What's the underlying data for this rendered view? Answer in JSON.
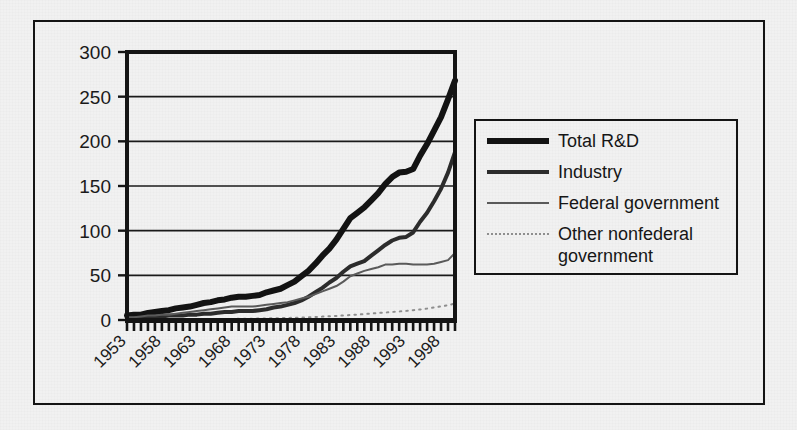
{
  "chart_data": {
    "type": "line",
    "title": "",
    "xlabel": "",
    "ylabel": "",
    "xlim": [
      1953,
      2000
    ],
    "ylim": [
      0,
      300
    ],
    "ytick_values": [
      0,
      50,
      100,
      150,
      200,
      250,
      300
    ],
    "ytick_labels": [
      "0",
      "50",
      "100",
      "150",
      "200",
      "250",
      "300"
    ],
    "xtick_labels": [
      "1953",
      "1958",
      "1963",
      "1968",
      "1973",
      "1978",
      "1983",
      "1988",
      "1993",
      "1998"
    ],
    "xtick_values": [
      1953,
      1958,
      1963,
      1968,
      1973,
      1978,
      1983,
      1988,
      1993,
      1998
    ],
    "xtick_rotation": 45,
    "minor_xticks": "annual",
    "grid": "horizontal",
    "legend_position": "right-outside",
    "x": [
      1953,
      1954,
      1955,
      1956,
      1957,
      1958,
      1959,
      1960,
      1961,
      1962,
      1963,
      1964,
      1965,
      1966,
      1967,
      1968,
      1969,
      1970,
      1971,
      1972,
      1973,
      1974,
      1975,
      1976,
      1977,
      1978,
      1979,
      1980,
      1981,
      1982,
      1983,
      1984,
      1985,
      1986,
      1987,
      1988,
      1989,
      1990,
      1991,
      1992,
      1993,
      1994,
      1995,
      1996,
      1997,
      1998,
      1999,
      2000
    ],
    "series": [
      {
        "name": "Total R&D",
        "style": "thick-solid",
        "color": "#131313",
        "linewidth": 6,
        "values": [
          5,
          6,
          6,
          8,
          9,
          10,
          11,
          13,
          14,
          15,
          17,
          19,
          20,
          22,
          23,
          25,
          26,
          26,
          27,
          28,
          31,
          33,
          35,
          39,
          43,
          49,
          55,
          63,
          72,
          80,
          90,
          102,
          114,
          120,
          126,
          134,
          142,
          152,
          160,
          165,
          166,
          169,
          184,
          197,
          212,
          227,
          247,
          268
        ]
      },
      {
        "name": "Industry",
        "style": "medium-solid",
        "color": "#2c2c2c",
        "linewidth": 4,
        "values": [
          2,
          2,
          2,
          3,
          4,
          4,
          5,
          5,
          5,
          6,
          6,
          7,
          7,
          8,
          9,
          9,
          10,
          10,
          10,
          11,
          12,
          14,
          15,
          17,
          19,
          22,
          26,
          31,
          36,
          42,
          47,
          54,
          60,
          63,
          66,
          72,
          78,
          84,
          89,
          92,
          93,
          98,
          110,
          120,
          133,
          147,
          165,
          188
        ]
      },
      {
        "name": "Federal government",
        "style": "thin-solid",
        "color": "#5a5a5a",
        "linewidth": 2,
        "values": [
          3,
          3,
          4,
          5,
          5,
          6,
          6,
          7,
          8,
          9,
          10,
          11,
          12,
          13,
          14,
          15,
          15,
          15,
          15,
          16,
          17,
          18,
          19,
          20,
          22,
          24,
          26,
          29,
          32,
          35,
          38,
          43,
          49,
          52,
          55,
          57,
          59,
          62,
          62,
          63,
          63,
          62,
          62,
          62,
          63,
          65,
          67,
          75
        ]
      },
      {
        "name": "Other nonfederal government",
        "style": "dotted",
        "color": "#8e8e8e",
        "linewidth": 2,
        "values": [
          0.2,
          0.2,
          0.3,
          0.3,
          0.4,
          0.4,
          0.5,
          0.5,
          0.6,
          0.6,
          0.7,
          0.8,
          0.9,
          1.0,
          1.1,
          1.2,
          1.3,
          1.4,
          1.5,
          1.6,
          1.8,
          1.9,
          2.1,
          2.3,
          2.5,
          2.8,
          3.1,
          3.4,
          3.8,
          4.2,
          4.6,
          5.1,
          5.6,
          6.1,
          6.6,
          7.2,
          7.8,
          8.4,
          9.0,
          9.6,
          10.2,
          11.0,
          11.8,
          12.8,
          14.0,
          15.2,
          16.6,
          18.4
        ]
      }
    ]
  },
  "legend": {
    "entries": [
      {
        "label": "Total R&D",
        "swatch": "thick-solid-line-icon"
      },
      {
        "label": "Industry",
        "swatch": "medium-solid-line-icon"
      },
      {
        "label": "Federal government",
        "swatch": "thin-solid-line-icon"
      },
      {
        "label": "Other nonfederal\ngovernment",
        "swatch": "dotted-line-icon"
      }
    ]
  },
  "colors": {
    "background": "#f1f1f1",
    "frame": "#141414",
    "total_rd": "#131313",
    "industry": "#2c2c2c",
    "federal": "#5a5a5a",
    "other": "#8e8e8e",
    "gridline": "#1a1a1a"
  }
}
